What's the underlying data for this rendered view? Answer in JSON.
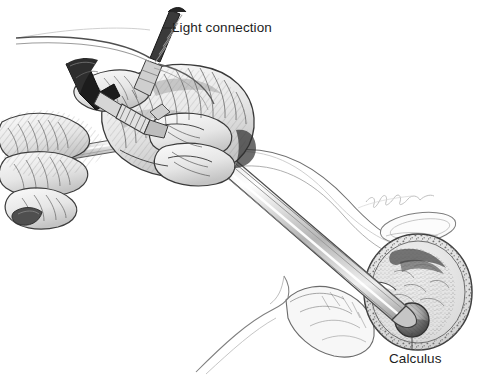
{
  "figure": {
    "medium": "pen-and-ink medical illustration",
    "background_color": "#ffffff",
    "ink_color": "#1d1d1d",
    "width": 478,
    "height": 376
  },
  "labels": {
    "light_connection": "Light connection",
    "calculus": "Calculus"
  },
  "signature": {
    "text": "artist-signature",
    "color": "#9a9a9a"
  },
  "parts": {
    "light_cable": "light-cable",
    "eyepiece": "eyepiece-funnel",
    "knurled_collar": "knurled-collar",
    "sheath_collar": "sheath-collar",
    "scope_shaft": "scope-shaft",
    "operator_hand": "operator-hand",
    "support_fingers": "support-fingers",
    "bladder": "bladder-cross-section",
    "stone": "calculus-stone",
    "pelvic_outline": "pelvic-anatomy-outline"
  }
}
